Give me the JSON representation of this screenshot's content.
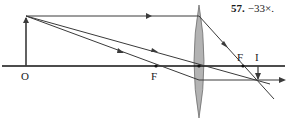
{
  "problem": {
    "number": "57.",
    "answer": "−33×."
  },
  "labels": {
    "object_point": "O",
    "focal_left": "F",
    "focal_right": "F",
    "image": "I"
  },
  "colors": {
    "line": "#3a3a3a",
    "axis": "#111111",
    "lens_fill": "#b3b3b3",
    "lens_stroke": "#6e6e6e"
  }
}
